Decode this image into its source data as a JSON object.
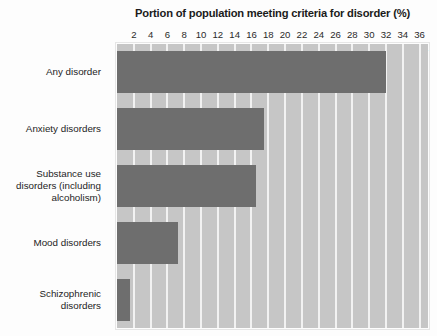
{
  "chart_data": {
    "type": "bar",
    "orientation": "horizontal",
    "title": "Portion of population meeting criteria for disorder (%)",
    "xlabel": "Portion of population meeting criteria for disorder (%)",
    "ylabel": "Category",
    "categories": [
      "Any disorder",
      "Anxiety disorders",
      "Substance use disorders (including alcoholism)",
      "Mood disorders",
      "Schizophrenic disorders"
    ],
    "values": [
      32,
      17.5,
      16.5,
      7.3,
      1.5
    ],
    "xlim": [
      0,
      37
    ],
    "xticks": [
      2,
      4,
      6,
      8,
      10,
      12,
      14,
      16,
      18,
      20,
      22,
      24,
      26,
      28,
      30,
      32,
      34,
      36
    ],
    "xticklabels": [
      "2",
      "4",
      "6",
      "8",
      "10",
      "12",
      "14",
      "16",
      "18",
      "20",
      "22",
      "24",
      "26",
      "28",
      "30",
      "32",
      "34",
      "36"
    ],
    "grid": true,
    "legend": false,
    "colors": {
      "bar": "#6e6e6e",
      "plot_background": "#c6c6c6",
      "gridline": "#f2f2f2",
      "page_background": "#fdfdfd",
      "text": "#1b1b1b"
    }
  },
  "axis": {
    "category_header": "Category"
  }
}
